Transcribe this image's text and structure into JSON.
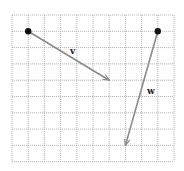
{
  "diagram": {
    "type": "vector-grid",
    "grid": {
      "columns": 10,
      "rows": 9,
      "origin_px": [
        12,
        15
      ],
      "cell_w_px": 16.2,
      "cell_h_px": 16.3,
      "line_color": "#a8a8a8"
    },
    "vectors": [
      {
        "id": "v",
        "label": "v",
        "start": [
          1,
          1
        ],
        "end": [
          6,
          4
        ],
        "color": "#8a8a8a",
        "label_pos_px": [
          70,
          54
        ]
      },
      {
        "id": "w",
        "label": "w",
        "start": [
          9,
          1
        ],
        "end": [
          7,
          8
        ],
        "color": "#8a8a8a",
        "label_pos_px": [
          147,
          94
        ]
      }
    ]
  }
}
